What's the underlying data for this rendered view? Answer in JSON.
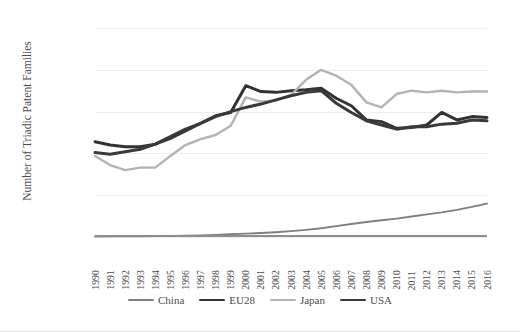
{
  "title_strip": "",
  "chart_data": {
    "type": "line",
    "title": "",
    "xlabel": "",
    "ylabel": "Number of Triadic Patent Families",
    "ylim": [
      0,
      25000
    ],
    "yticks": [
      0,
      5000,
      10000,
      15000,
      20000,
      25000
    ],
    "ytick_labels": [
      "0",
      "5,000",
      "10,000",
      "15,000",
      "20,000",
      "25,000"
    ],
    "grid": true,
    "legend_position": "bottom",
    "x": [
      1990,
      1991,
      1992,
      1993,
      1994,
      1995,
      1996,
      1997,
      1998,
      1999,
      2000,
      2001,
      2002,
      2003,
      2004,
      2005,
      2006,
      2007,
      2008,
      2009,
      2010,
      2011,
      2012,
      2013,
      2014,
      2015,
      2016
    ],
    "categories": [
      "1990",
      "1991",
      "1992",
      "1993",
      "1994",
      "1995",
      "1996",
      "1997",
      "1998",
      "1999",
      "2000",
      "2001",
      "2002",
      "2003",
      "2004",
      "2005",
      "2006",
      "2007",
      "2008",
      "2009",
      "2010",
      "2011",
      "2012",
      "2013",
      "2014",
      "2015",
      "2016"
    ],
    "series": [
      {
        "name": "China",
        "color": "#7f7f7f",
        "width": 1.9,
        "values": [
          60,
          70,
          80,
          90,
          110,
          130,
          160,
          200,
          250,
          320,
          400,
          480,
          570,
          700,
          850,
          1050,
          1300,
          1550,
          1800,
          2000,
          2200,
          2450,
          2700,
          2950,
          3250,
          3600,
          4000
        ]
      },
      {
        "name": "EU28",
        "color": "#333333",
        "width": 3.0,
        "values": [
          11400,
          11000,
          10800,
          10800,
          11100,
          11800,
          12700,
          13600,
          14500,
          14900,
          18100,
          17400,
          17300,
          17500,
          17600,
          17800,
          16600,
          15700,
          14000,
          13800,
          13000,
          13100,
          13400,
          14900,
          14000,
          14400,
          14300
        ]
      },
      {
        "name": "Japan",
        "color": "#b3b3b3",
        "width": 2.4,
        "values": [
          9700,
          8600,
          8000,
          8300,
          8300,
          9700,
          11000,
          11700,
          12200,
          13300,
          16700,
          16200,
          16300,
          17000,
          18800,
          20000,
          19300,
          18200,
          16100,
          15500,
          17100,
          17500,
          17300,
          17500,
          17300,
          17400,
          17400
        ]
      },
      {
        "name": "USA",
        "color": "#3a3a3a",
        "width": 3.0,
        "values": [
          10100,
          9900,
          10200,
          10500,
          11100,
          12000,
          12900,
          13600,
          14400,
          15000,
          15500,
          15900,
          16400,
          16900,
          17300,
          17500,
          16000,
          14900,
          13900,
          13400,
          12900,
          13200,
          13200,
          13500,
          13600,
          14000,
          13900
        ]
      }
    ]
  },
  "legend": {
    "items": [
      {
        "label": "China",
        "color": "#7f7f7f"
      },
      {
        "label": "EU28",
        "color": "#333333"
      },
      {
        "label": "Japan",
        "color": "#b3b3b3"
      },
      {
        "label": "USA",
        "color": "#3a3a3a"
      }
    ]
  }
}
